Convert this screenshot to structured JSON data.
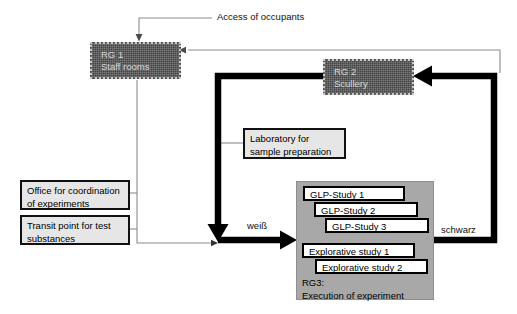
{
  "diagram": {
    "title": "Access of occupants",
    "rooms": [
      {
        "id": "rg1",
        "code": "RG 1",
        "name": "Staff rooms"
      },
      {
        "id": "rg2",
        "code": "RG 2",
        "name": "Scullery"
      }
    ],
    "labels": {
      "access": "Access of occupants",
      "laboratory_line1": "Laboratory for",
      "laboratory_line2": "sample preparation",
      "office_line1": "Office for coordination",
      "office_line2": "of experiments",
      "transit_line1": "Transit point for test",
      "transit_line2": "substances"
    },
    "flow_labels": {
      "white": "weiß",
      "black": "schwarz"
    },
    "rg3": {
      "caption_line1": "RG3:",
      "caption_line2": "Execution of experiment",
      "studies": [
        "GLP-Study 1",
        "GLP-Study 2",
        "GLP-Study 3",
        "Explorative study 1",
        "Explorative study 2"
      ]
    },
    "colors": {
      "room_fill": "#595959",
      "room_text": "#d9d9d9",
      "label_fill": "#e6e6e6",
      "rg3_fill": "#a8a8a8",
      "thick_flow": "#000000",
      "thin_flow": "#8c8c8c",
      "study_fill": "#ffffff"
    }
  }
}
